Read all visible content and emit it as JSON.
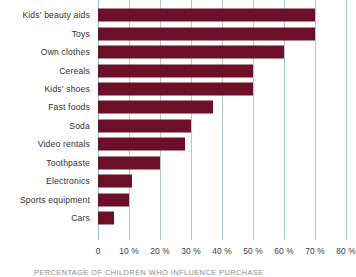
{
  "chart_data": {
    "type": "bar",
    "orientation": "horizontal",
    "title": "",
    "xlabel": "",
    "ylabel": "",
    "xlim": [
      0,
      80
    ],
    "grid": true,
    "legend": false,
    "categories": [
      "Kids' beauty aids",
      "Toys",
      "Own clothes",
      "Cereals",
      "Kids' shoes",
      "Fast foods",
      "Soda",
      "Video rentals",
      "Toothpaste",
      "Electronics",
      "Sports equipment",
      "Cars"
    ],
    "values": [
      70,
      70,
      60,
      50,
      50,
      37,
      30,
      28,
      20,
      11,
      10,
      5
    ],
    "tick_labels": [
      "0",
      "10 %",
      "20 %",
      "30 %",
      "40 %",
      "50 %",
      "60 %",
      "70 %",
      "80 %"
    ],
    "tick_values": [
      0,
      10,
      20,
      30,
      40,
      50,
      60,
      70,
      80
    ],
    "bar_color": "#6b1028",
    "grid_color": "#a8cdd9",
    "caption": "PERCENTAGE OF CHILDREN WHO INFLUENCE PURCHASE"
  }
}
